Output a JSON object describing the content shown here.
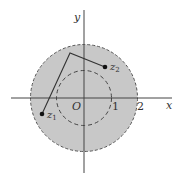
{
  "diagram": {
    "colors": {
      "fill": "#c8c8c8",
      "stroke": "#555555",
      "axis": "#444444",
      "line": "#333333",
      "point": "#111111"
    },
    "axes": {
      "x_label": "x",
      "y_label": "y",
      "origin_label": "O",
      "ticks": [
        {
          "value": 1,
          "label": "1"
        },
        {
          "value": 2,
          "label": "2"
        }
      ]
    },
    "regions": {
      "outer_circle": {
        "radius": 2,
        "style": "dashed",
        "filled": true
      },
      "inner_circle": {
        "radius": 1,
        "style": "dashed",
        "filled": false
      }
    },
    "points": [
      {
        "id": "z1",
        "label": "z",
        "subscript": "1"
      },
      {
        "id": "z2",
        "label": "z",
        "subscript": "2"
      }
    ],
    "path": {
      "description": "polygonal line from z1 to z2 with one vertex"
    }
  }
}
